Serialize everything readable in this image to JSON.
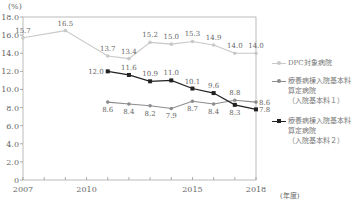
{
  "chart_data": {
    "type": "line",
    "title": "",
    "ylabel": "(%)",
    "xlabel": "(年度)",
    "ylim": [
      0,
      18
    ],
    "xlim": [
      2007,
      2018
    ],
    "yticks": [
      0,
      2.0,
      4.0,
      6.0,
      8.0,
      10.0,
      12.0,
      14.0,
      16.0,
      18.0
    ],
    "ytick_labels": [
      "0",
      "2.0",
      "4.0",
      "6.0",
      "8.0",
      "10.0",
      "12.0",
      "14.0",
      "16.0",
      "18.0"
    ],
    "xticks": [
      2007,
      2008,
      2009,
      2010,
      2011,
      2012,
      2013,
      2014,
      2015,
      2016,
      2017,
      2018
    ],
    "xtick_labels": [
      {
        "x": 2007,
        "label": "2007"
      },
      {
        "x": 2010,
        "label": "2010"
      },
      {
        "x": 2015,
        "label": "2015"
      },
      {
        "x": 2018,
        "label": "2018"
      }
    ],
    "grid": false,
    "legend_position": "right",
    "series": [
      {
        "name": "DPC対象病院",
        "color": "#c8c8c8",
        "marker": "circle",
        "x": [
          2007,
          2009,
          2011,
          2012,
          2013,
          2014,
          2015,
          2016,
          2017,
          2018
        ],
        "values": [
          15.7,
          16.5,
          13.7,
          13.4,
          15.2,
          15.0,
          15.3,
          14.9,
          14.0,
          14.0
        ],
        "label_pos": "above"
      },
      {
        "name": "療養病棟入院基本料算定病院（入院基本料１）",
        "legend_lines": [
          "療養病棟入院基本料",
          "算定病院",
          "（入院基本料１）"
        ],
        "color": "#8c8c8c",
        "marker": "circle",
        "x": [
          2011,
          2012,
          2013,
          2014,
          2015,
          2016,
          2017,
          2018
        ],
        "values": [
          8.6,
          8.4,
          8.2,
          7.9,
          8.7,
          8.4,
          8.8,
          8.6
        ],
        "label_pos": [
          "below",
          "below",
          "below",
          "below",
          "below",
          "below",
          "above",
          "right"
        ]
      },
      {
        "name": "療養病棟入院基本料算定病院（入院基本料２）",
        "legend_lines": [
          "療養病棟入院基本料",
          "算定病院",
          "（入院基本料２）"
        ],
        "color": "#222222",
        "marker": "square",
        "x": [
          2011,
          2012,
          2013,
          2014,
          2015,
          2016,
          2017,
          2018
        ],
        "values": [
          12.0,
          11.6,
          10.9,
          11.0,
          10.1,
          9.6,
          8.3,
          7.8
        ],
        "label_pos": [
          "left",
          "above",
          "above",
          "above",
          "above",
          "above",
          "below",
          "right"
        ]
      }
    ]
  }
}
